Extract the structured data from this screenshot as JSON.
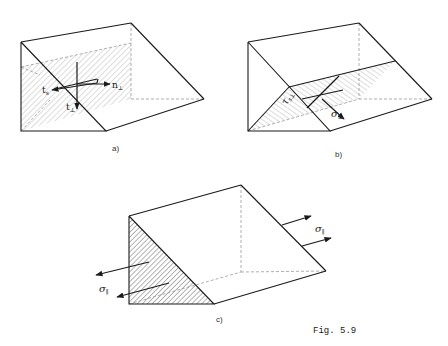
{
  "figure": {
    "caption": "Fig. 5.9",
    "panels": [
      {
        "id": "a",
        "label": "a)",
        "vectors": [
          {
            "name": "t_s",
            "base": "t",
            "sub": "s"
          },
          {
            "name": "n_perp",
            "base": "n",
            "sub": "⊥"
          },
          {
            "name": "t_perp",
            "base": "t",
            "sub": "⊥"
          }
        ]
      },
      {
        "id": "b",
        "label": "b)",
        "vectors": [
          {
            "name": "tau_s_perp",
            "base": "τ",
            "sub": "s⊥"
          },
          {
            "name": "sigma_perp",
            "base": "σ",
            "sub": "⊥"
          }
        ]
      },
      {
        "id": "c",
        "label": "c)",
        "vectors": [
          {
            "name": "sigma_par_right",
            "base": "σ",
            "sub": "∥"
          },
          {
            "name": "sigma_par_left",
            "base": "σ",
            "sub": "∥"
          }
        ]
      }
    ]
  },
  "colors": {
    "line": "#1a1a1a",
    "hidden": "#9a9a9a",
    "hatch": "#8a8a8a",
    "background": "#ffffff"
  }
}
